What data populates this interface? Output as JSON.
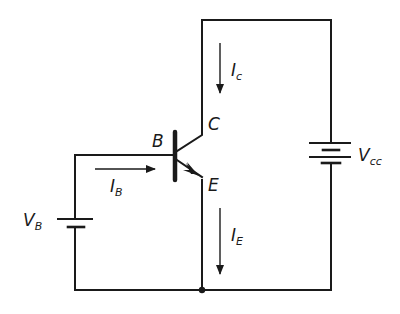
{
  "diagram": {
    "type": "circuit",
    "labels": {
      "base": "B",
      "collector": "C",
      "emitter": "E",
      "ic_main": "I",
      "ic_sub": "c",
      "ib_main": "I",
      "ib_sub": "B",
      "ie_main": "I",
      "ie_sub": "E",
      "vb_main": "V",
      "vb_sub": "B",
      "vcc_main": "V",
      "vcc_sub": "cc"
    },
    "components": [
      {
        "id": "Q1",
        "kind": "npn-transistor",
        "terminals": [
          "B",
          "C",
          "E"
        ]
      },
      {
        "id": "VB",
        "kind": "battery",
        "label": "V_B"
      },
      {
        "id": "VCC",
        "kind": "battery",
        "label": "V_cc"
      }
    ],
    "currents": [
      {
        "label": "I_c",
        "direction": "down",
        "branch": "collector"
      },
      {
        "label": "I_B",
        "direction": "right",
        "branch": "base"
      },
      {
        "label": "I_E",
        "direction": "down",
        "branch": "emitter"
      }
    ],
    "colors": {
      "ink": "#1a1a1a",
      "background": "#ffffff"
    }
  }
}
